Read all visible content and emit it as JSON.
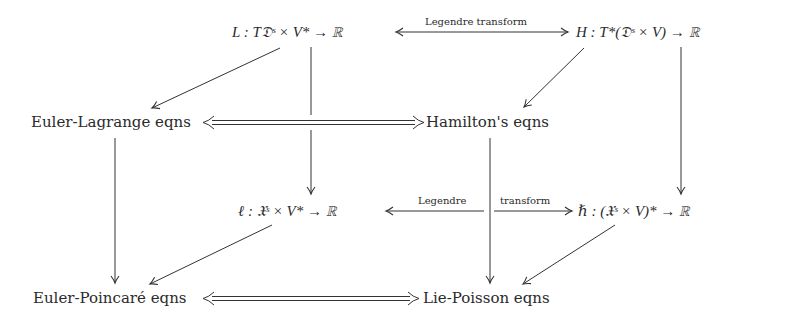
{
  "diagram": {
    "type": "commutative-cube",
    "nodes": {
      "lagrangian": "L : T𝔇ˢ × V* → ℝ",
      "hamiltonian": "H : T*(𝔇ˢ × V) → ℝ",
      "euler_lagrange": "Euler-Lagrange eqns",
      "hamiltons": "Hamilton's eqns",
      "reduced_lagrangian": "ℓ : 𝔛ˢ × V* → ℝ",
      "reduced_hamiltonian": "ℏ : (𝔛ˢ × V)* → ℝ",
      "euler_poincare": "Euler-Poincaré eqns",
      "lie_poisson": "Lie-Poisson eqns"
    },
    "edge_labels": {
      "top_legendre": "Legendre transform",
      "bottom_legendre_left": "Legendre",
      "bottom_legendre_right": "transform"
    },
    "edges": [
      {
        "from": "lagrangian",
        "to": "hamiltonian",
        "style": "single-bidirectional",
        "label": "Legendre transform"
      },
      {
        "from": "reduced_lagrangian",
        "to": "reduced_hamiltonian",
        "style": "single-bidirectional",
        "label": "Legendre transform"
      },
      {
        "from": "euler_lagrange",
        "to": "hamiltons",
        "style": "double-bidirectional"
      },
      {
        "from": "euler_poincare",
        "to": "lie_poisson",
        "style": "double-bidirectional"
      },
      {
        "from": "lagrangian",
        "to": "euler_lagrange",
        "style": "single"
      },
      {
        "from": "hamiltonian",
        "to": "hamiltons",
        "style": "single"
      },
      {
        "from": "reduced_lagrangian",
        "to": "euler_poincare",
        "style": "single"
      },
      {
        "from": "reduced_hamiltonian",
        "to": "lie_poisson",
        "style": "single"
      },
      {
        "from": "lagrangian",
        "to": "reduced_lagrangian",
        "style": "single"
      },
      {
        "from": "hamiltonian",
        "to": "reduced_hamiltonian",
        "style": "single"
      },
      {
        "from": "euler_lagrange",
        "to": "euler_poincare",
        "style": "single"
      },
      {
        "from": "hamiltons",
        "to": "lie_poisson",
        "style": "single"
      }
    ]
  }
}
